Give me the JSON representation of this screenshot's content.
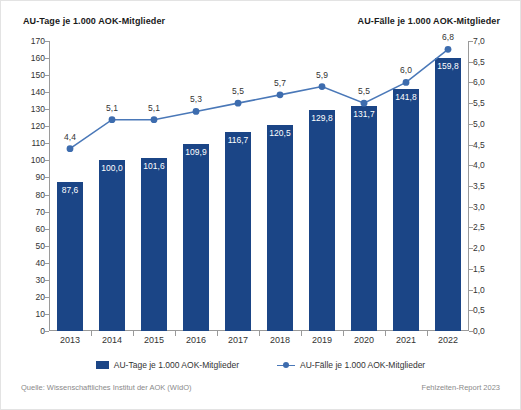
{
  "titles": {
    "left_axis": "AU-Tage je 1.000 AOK-Mitglieder",
    "right_axis": "AU-Fälle je 1.000 AOK-Mitglieder"
  },
  "footer": {
    "source": "Quelle: Wissenschaftliches Institut der AOK (WIdO)",
    "report": "Fehlzeiten-Report 2023"
  },
  "legend": {
    "items": [
      {
        "label": "AU-Tage je 1.000 AOK-Mitglieder",
        "marker": "bar-swatch",
        "color": "#1b4586"
      },
      {
        "label": "AU-Fälle je 1.000 AOK-Mitglieder",
        "marker": "line-swatch",
        "color": "#4a78b8"
      }
    ]
  },
  "chart_data": {
    "type": "bar",
    "title": "",
    "categories": [
      "2013",
      "2014",
      "2015",
      "2016",
      "2017",
      "2018",
      "2019",
      "2020",
      "2021",
      "2022"
    ],
    "xlabel": "",
    "grid": false,
    "legend_position": "bottom",
    "series": [
      {
        "name": "AU-Tage je 1.000 AOK-Mitglieder",
        "type": "bar",
        "axis": "left",
        "color": "#1b4586",
        "values": [
          87.6,
          100.0,
          101.6,
          109.9,
          116.7,
          120.5,
          129.8,
          131.7,
          141.8,
          159.8
        ],
        "value_labels": [
          "87,6",
          "100,0",
          "101,6",
          "109,9",
          "116,7",
          "120,5",
          "129,8",
          "131,7",
          "141,8",
          "159,8"
        ]
      },
      {
        "name": "AU-Fälle je 1.000 AOK-Mitglieder",
        "type": "line",
        "axis": "right",
        "color": "#4a78b8",
        "values": [
          4.4,
          5.1,
          5.1,
          5.3,
          5.5,
          5.7,
          5.9,
          5.5,
          6.0,
          6.8
        ],
        "value_labels": [
          "4,4",
          "5,1",
          "5,1",
          "5,3",
          "5,5",
          "5,7",
          "5,9",
          "5,5",
          "6,0",
          "6,8"
        ]
      }
    ],
    "left_axis": {
      "label": "AU-Tage je 1.000 AOK-Mitglieder",
      "ylim": [
        0,
        170
      ],
      "tick_step": 10,
      "ticks": [
        0,
        10,
        20,
        30,
        40,
        50,
        60,
        70,
        80,
        90,
        100,
        110,
        120,
        130,
        140,
        150,
        160,
        170
      ],
      "tick_labels": [
        "0",
        "10",
        "20",
        "30",
        "40",
        "50",
        "60",
        "70",
        "80",
        "90",
        "100",
        "110",
        "120",
        "130",
        "140",
        "150",
        "160",
        "170"
      ]
    },
    "right_axis": {
      "label": "AU-Fälle je 1.000 AOK-Mitglieder",
      "ylim": [
        0,
        7
      ],
      "tick_step": 0.5,
      "ticks": [
        0,
        0.5,
        1,
        1.5,
        2,
        2.5,
        3,
        3.5,
        4,
        4.5,
        5,
        5.5,
        6,
        6.5,
        7
      ],
      "tick_labels": [
        "0,0",
        "0,5",
        "1,0",
        "1,5",
        "2,0",
        "2,5",
        "3,0",
        "3,5",
        "4,0",
        "4,5",
        "5,0",
        "5,5",
        "6,0",
        "6,5",
        "7,0"
      ]
    }
  }
}
